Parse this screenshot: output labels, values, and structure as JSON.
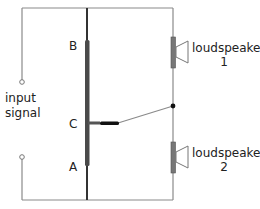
{
  "diagram": {
    "labels": {
      "input": "input",
      "signal": "signal",
      "terminal_b": "B",
      "terminal_c": "C",
      "terminal_a": "A",
      "speaker1_name": "loudspeaker",
      "speaker1_num": "1",
      "speaker2_name": "loudspeaker",
      "speaker2_num": "2"
    },
    "colors": {
      "wire": "#7a7a7a",
      "rheostat": "#444444",
      "slider": "#111111",
      "speaker_body": "#777777"
    }
  }
}
